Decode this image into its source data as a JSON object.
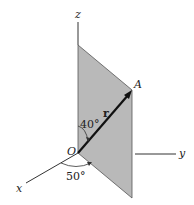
{
  "figure": {
    "type": "3d-vector-diagram",
    "axes": {
      "x": {
        "label": "x"
      },
      "y": {
        "label": "y"
      },
      "z": {
        "label": "z"
      }
    },
    "origin": {
      "label": "O"
    },
    "point": {
      "label": "A"
    },
    "vector": {
      "label": "r"
    },
    "angles": {
      "from_z": "40°",
      "from_x": "50°"
    },
    "colors": {
      "plane_fill": "#b9b9b9",
      "line": "#222222",
      "background": "#ffffff"
    }
  }
}
